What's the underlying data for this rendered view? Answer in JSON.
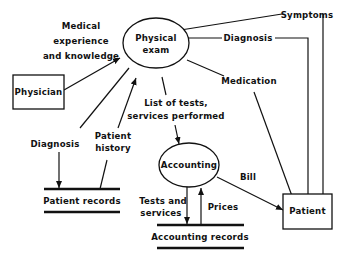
{
  "diagram": {
    "type": "data-flow-diagram",
    "nodes": {
      "physician": {
        "label": "Physician",
        "shape": "rectangle"
      },
      "physical_exam": {
        "label_line1": "Physical",
        "label_line2": "exam",
        "shape": "ellipse"
      },
      "accounting": {
        "label": "Accounting",
        "shape": "ellipse"
      },
      "patient": {
        "label": "Patient",
        "shape": "rectangle"
      },
      "patient_records": {
        "label": "Patient records",
        "shape": "data-store"
      },
      "accounting_records": {
        "label": "Accounting records",
        "shape": "data-store"
      }
    },
    "flows": {
      "medical_experience": {
        "line1": "Medical",
        "line2": "experience",
        "line3": "and knowledge",
        "from": "physician",
        "to": "physical_exam"
      },
      "symptoms": {
        "label": "Symptoms",
        "from": "patient",
        "to": "physical_exam"
      },
      "diagnosis_to_patient": {
        "label": "Diagnosis",
        "from": "physical_exam",
        "to": "patient"
      },
      "medication": {
        "label": "Medication",
        "from": "physical_exam",
        "to": "patient"
      },
      "list_of_tests": {
        "line1": "List of tests,",
        "line2": "services performed",
        "from": "physical_exam",
        "to": "accounting"
      },
      "diagnosis_to_records": {
        "label": "Diagnosis",
        "from": "physical_exam",
        "to": "patient_records"
      },
      "patient_history": {
        "line1": "Patient",
        "line2": "history",
        "from": "patient_records",
        "to": "physical_exam"
      },
      "bill": {
        "label": "Bill",
        "from": "accounting",
        "to": "patient"
      },
      "tests_and_services": {
        "line1": "Tests and",
        "line2": "services",
        "from": "accounting",
        "to": "accounting_records"
      },
      "prices": {
        "label": "Prices",
        "from": "accounting_records",
        "to": "accounting"
      }
    },
    "colors": {
      "ink": "#111111",
      "background": "#ffffff"
    }
  }
}
